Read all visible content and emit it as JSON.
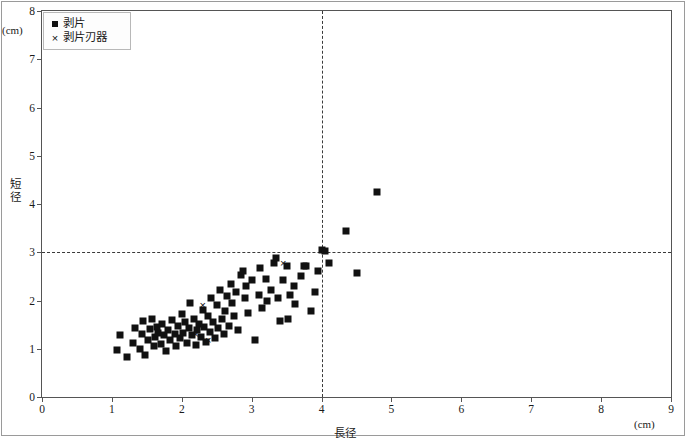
{
  "chart_data": {
    "type": "scatter",
    "title": "砂田台遺跡 Ⅲ期",
    "xlabel": "長径",
    "ylabel": "短径",
    "x_unit": "(cm)",
    "y_unit": "(cm)",
    "xlim": [
      0,
      9
    ],
    "ylim": [
      0,
      8
    ],
    "xticks": [
      "0",
      "1",
      "2",
      "3",
      "4",
      "5",
      "6",
      "7",
      "8",
      "9"
    ],
    "yticks": [
      "0",
      "1",
      "2",
      "3",
      "4",
      "5",
      "6",
      "7",
      "8"
    ],
    "grid": false,
    "reference_lines": {
      "vertical_x": 4,
      "horizontal_y": 3
    },
    "legend": {
      "position": "top-left",
      "entries": [
        {
          "label": "剥片",
          "marker": "square"
        },
        {
          "label": "剥片刃器",
          "marker": "cross"
        }
      ]
    },
    "series": [
      {
        "name": "剥片",
        "marker": "square",
        "color": "#111111",
        "points": [
          [
            1.07,
            0.97
          ],
          [
            1.12,
            1.28
          ],
          [
            1.22,
            0.82
          ],
          [
            1.3,
            1.12
          ],
          [
            1.33,
            1.44
          ],
          [
            1.4,
            1.0
          ],
          [
            1.43,
            1.3
          ],
          [
            1.45,
            1.57
          ],
          [
            1.48,
            0.88
          ],
          [
            1.52,
            1.18
          ],
          [
            1.55,
            1.4
          ],
          [
            1.57,
            1.62
          ],
          [
            1.6,
            1.05
          ],
          [
            1.62,
            1.24
          ],
          [
            1.64,
            1.45
          ],
          [
            1.66,
            1.33
          ],
          [
            1.7,
            1.1
          ],
          [
            1.72,
            1.52
          ],
          [
            1.75,
            1.28
          ],
          [
            1.78,
            0.95
          ],
          [
            1.8,
            1.38
          ],
          [
            1.83,
            1.18
          ],
          [
            1.86,
            1.6
          ],
          [
            1.9,
            1.3
          ],
          [
            1.92,
            1.05
          ],
          [
            1.95,
            1.47
          ],
          [
            1.98,
            1.22
          ],
          [
            2.0,
            1.72
          ],
          [
            2.02,
            1.33
          ],
          [
            2.05,
            1.55
          ],
          [
            2.08,
            1.12
          ],
          [
            2.1,
            1.42
          ],
          [
            2.12,
            1.95
          ],
          [
            2.15,
            1.28
          ],
          [
            2.18,
            1.62
          ],
          [
            2.2,
            1.08
          ],
          [
            2.22,
            1.38
          ],
          [
            2.25,
            1.52
          ],
          [
            2.28,
            1.25
          ],
          [
            2.3,
            1.8
          ],
          [
            2.32,
            1.45
          ],
          [
            2.35,
            1.15
          ],
          [
            2.38,
            1.68
          ],
          [
            2.4,
            1.35
          ],
          [
            2.42,
            2.05
          ],
          [
            2.45,
            1.55
          ],
          [
            2.48,
            1.22
          ],
          [
            2.5,
            1.9
          ],
          [
            2.52,
            1.42
          ],
          [
            2.55,
            2.22
          ],
          [
            2.58,
            1.62
          ],
          [
            2.6,
            1.3
          ],
          [
            2.62,
            1.78
          ],
          [
            2.65,
            2.1
          ],
          [
            2.68,
            1.48
          ],
          [
            2.7,
            2.35
          ],
          [
            2.72,
            1.95
          ],
          [
            2.75,
            1.68
          ],
          [
            2.78,
            2.18
          ],
          [
            2.8,
            1.38
          ],
          [
            2.85,
            2.52
          ],
          [
            2.88,
            2.62
          ],
          [
            2.9,
            2.05
          ],
          [
            2.92,
            2.3
          ],
          [
            2.95,
            1.75
          ],
          [
            3.0,
            2.42
          ],
          [
            3.05,
            1.18
          ],
          [
            3.1,
            2.12
          ],
          [
            3.12,
            2.68
          ],
          [
            3.15,
            1.85
          ],
          [
            3.2,
            2.45
          ],
          [
            3.22,
            2.0
          ],
          [
            3.28,
            2.22
          ],
          [
            3.32,
            2.78
          ],
          [
            3.35,
            2.88
          ],
          [
            3.38,
            2.05
          ],
          [
            3.4,
            1.58
          ],
          [
            3.45,
            2.42
          ],
          [
            3.5,
            2.72
          ],
          [
            3.52,
            1.62
          ],
          [
            3.55,
            2.12
          ],
          [
            3.6,
            2.3
          ],
          [
            3.62,
            1.92
          ],
          [
            3.7,
            2.5
          ],
          [
            3.75,
            2.72
          ],
          [
            3.78,
            2.72
          ],
          [
            3.85,
            1.78
          ],
          [
            3.9,
            2.18
          ],
          [
            3.95,
            2.62
          ],
          [
            4.0,
            3.05
          ],
          [
            4.05,
            3.02
          ],
          [
            4.1,
            2.78
          ],
          [
            4.35,
            3.45
          ],
          [
            4.5,
            2.57
          ],
          [
            4.8,
            4.25
          ]
        ]
      },
      {
        "name": "剥片刃器",
        "marker": "cross",
        "color": "#111111",
        "points": [
          [
            2.3,
            1.9
          ],
          [
            2.2,
            1.3
          ],
          [
            2.38,
            1.18
          ],
          [
            3.45,
            2.78
          ]
        ]
      }
    ]
  }
}
